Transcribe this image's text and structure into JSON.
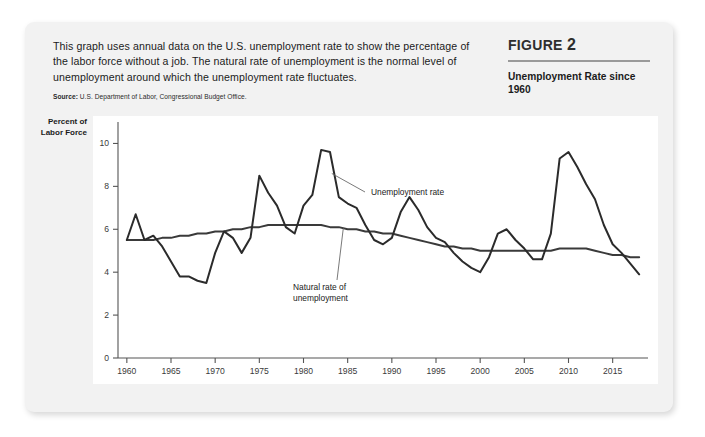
{
  "card": {
    "description": [
      "This graph uses annual data on the U.S. unemployment rate to show the percentage of",
      "the labor force without a job. The natural rate of unemployment is the normal level of",
      "unemployment around which the unemployment rate fluctuates."
    ],
    "source_label": "Source:",
    "source_text": "U.S. Department of Labor, Congressional Budget Office."
  },
  "figure": {
    "label_word": "FIGURE",
    "number": "2",
    "subtitle": "Unemployment Rate since 1960"
  },
  "chart_data": {
    "type": "line",
    "title": "Unemployment Rate since 1960",
    "xlabel": "",
    "ylabel": "Percent of Labor Force",
    "ylabel_lines": [
      "Percent of",
      "Labor Force"
    ],
    "xlim": [
      1959,
      2019
    ],
    "ylim": [
      0,
      11
    ],
    "yticks": [
      0,
      2,
      4,
      6,
      8,
      10
    ],
    "ytick_labels": [
      "0",
      "2",
      "4",
      "6",
      "8",
      "10"
    ],
    "xticks": [
      1960,
      1965,
      1970,
      1975,
      1980,
      1985,
      1990,
      1995,
      2000,
      2005,
      2010,
      2015
    ],
    "xtick_labels": [
      "1960",
      "1965",
      "1970",
      "1975",
      "1980",
      "1985",
      "1990",
      "1995",
      "2000",
      "2005",
      "2010",
      "2015"
    ],
    "grid": false,
    "legend_position": "inline-annotations",
    "annotations": [
      {
        "name": "unemployment-rate-label",
        "text": "Unemployment rate",
        "lines": [
          "Unemployment rate"
        ]
      },
      {
        "name": "natural-rate-label",
        "text": "Natural rate of unemployment",
        "lines": [
          "Natural rate of",
          "unemployment"
        ]
      }
    ],
    "x": [
      1960,
      1961,
      1962,
      1963,
      1964,
      1965,
      1966,
      1967,
      1968,
      1969,
      1970,
      1971,
      1972,
      1973,
      1974,
      1975,
      1976,
      1977,
      1978,
      1979,
      1980,
      1981,
      1982,
      1983,
      1984,
      1985,
      1986,
      1987,
      1988,
      1989,
      1990,
      1991,
      1992,
      1993,
      1994,
      1995,
      1996,
      1997,
      1998,
      1999,
      2000,
      2001,
      2002,
      2003,
      2004,
      2005,
      2006,
      2007,
      2008,
      2009,
      2010,
      2011,
      2012,
      2013,
      2014,
      2015,
      2016,
      2017,
      2018
    ],
    "series": [
      {
        "name": "Unemployment rate",
        "color": "#2b2b2b",
        "values": [
          5.5,
          6.7,
          5.5,
          5.7,
          5.2,
          4.5,
          3.8,
          3.8,
          3.6,
          3.5,
          4.9,
          5.9,
          5.6,
          4.9,
          5.6,
          8.5,
          7.7,
          7.1,
          6.1,
          5.8,
          7.1,
          7.6,
          9.7,
          9.6,
          7.5,
          7.2,
          7.0,
          6.2,
          5.5,
          5.3,
          5.6,
          6.8,
          7.5,
          6.9,
          6.1,
          5.6,
          5.4,
          4.9,
          4.5,
          4.2,
          4.0,
          4.7,
          5.8,
          6.0,
          5.5,
          5.1,
          4.6,
          4.6,
          5.8,
          9.3,
          9.6,
          8.9,
          8.1,
          7.4,
          6.2,
          5.3,
          4.9,
          4.4,
          3.9
        ]
      },
      {
        "name": "Natural rate of unemployment",
        "color": "#3a3a3a",
        "values": [
          5.5,
          5.5,
          5.5,
          5.5,
          5.6,
          5.6,
          5.7,
          5.7,
          5.8,
          5.8,
          5.9,
          5.9,
          6.0,
          6.0,
          6.1,
          6.1,
          6.2,
          6.2,
          6.2,
          6.2,
          6.2,
          6.2,
          6.2,
          6.1,
          6.1,
          6.0,
          6.0,
          5.9,
          5.9,
          5.8,
          5.8,
          5.7,
          5.6,
          5.5,
          5.4,
          5.3,
          5.2,
          5.2,
          5.1,
          5.1,
          5.0,
          5.0,
          5.0,
          5.0,
          5.0,
          5.0,
          5.0,
          5.0,
          5.0,
          5.1,
          5.1,
          5.1,
          5.1,
          5.0,
          4.9,
          4.8,
          4.8,
          4.7,
          4.7
        ]
      }
    ]
  }
}
